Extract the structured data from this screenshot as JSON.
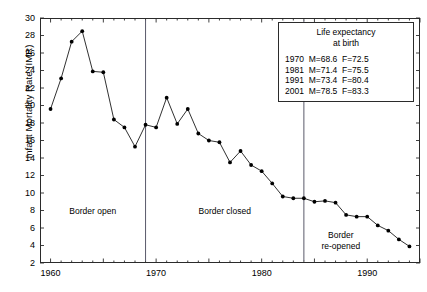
{
  "chart_data": {
    "type": "line",
    "title": "",
    "xlabel": "",
    "ylabel": "Infant Mortality Rate (IMR)",
    "xlim": [
      1959,
      1995
    ],
    "ylim": [
      2,
      30
    ],
    "xticks": [
      1960,
      1965,
      1970,
      1975,
      1980,
      1985,
      1990,
      1995
    ],
    "xtick_labels": [
      "1960",
      "",
      "1970",
      "",
      "1980",
      "",
      "1990",
      ""
    ],
    "yticks": [
      2,
      4,
      6,
      8,
      10,
      12,
      14,
      16,
      18,
      20,
      22,
      24,
      26,
      28,
      30
    ],
    "grid": false,
    "legend_position": "top-right",
    "marker": "filled-circle",
    "series": [
      {
        "name": "Infant Mortality Rate (IMR)",
        "x": [
          1960,
          1961,
          1962,
          1963,
          1964,
          1965,
          1966,
          1967,
          1968,
          1969,
          1970,
          1971,
          1972,
          1973,
          1974,
          1975,
          1976,
          1977,
          1978,
          1979,
          1980,
          1981,
          1982,
          1983,
          1984,
          1985,
          1986,
          1987,
          1988,
          1989,
          1990,
          1991,
          1992,
          1993,
          1994
        ],
        "values": [
          19.6,
          23.1,
          27.3,
          28.5,
          23.9,
          23.8,
          18.4,
          17.5,
          15.3,
          17.8,
          17.5,
          20.9,
          17.9,
          19.6,
          16.8,
          16.0,
          15.8,
          13.5,
          14.8,
          13.2,
          12.5,
          11.1,
          9.6,
          9.4,
          9.4,
          9.0,
          9.1,
          8.9,
          7.5,
          7.3,
          7.3,
          6.3,
          5.7,
          4.7,
          3.9
        ]
      }
    ],
    "vertical_dividers": [
      {
        "x": 1969.0,
        "label": ""
      },
      {
        "x": 1984.0,
        "label": ""
      }
    ],
    "annotations": [
      {
        "text": "Border open",
        "x": 1964.0,
        "y": 8.0
      },
      {
        "text": "Border closed",
        "x": 1976.5,
        "y": 8.0
      },
      {
        "text": "Border\nre-opened",
        "x": 1987.5,
        "y": 4.6
      }
    ]
  },
  "annotations": {
    "border_open": "Border open",
    "border_closed": "Border closed",
    "border_reopened_line1": "Border",
    "border_reopened_line2": "re-opened"
  },
  "axes": {
    "ylabel": "Infant Mortality Rate (IMR)"
  },
  "legend": {
    "title_line1": "Life expectancy",
    "title_line2": "at birth",
    "rows": [
      "1970  M=68.6  F=72.5",
      "1981  M=71.4  F=75.5",
      "1991  M=73.4  F=80.4",
      "2001  M=78.5  F=83.3"
    ]
  },
  "colors": {
    "line": "#1a1a1a",
    "marker": "#000000",
    "axis": "#2b2b2b",
    "divider": "#5a5a6a",
    "background": "#ffffff"
  }
}
